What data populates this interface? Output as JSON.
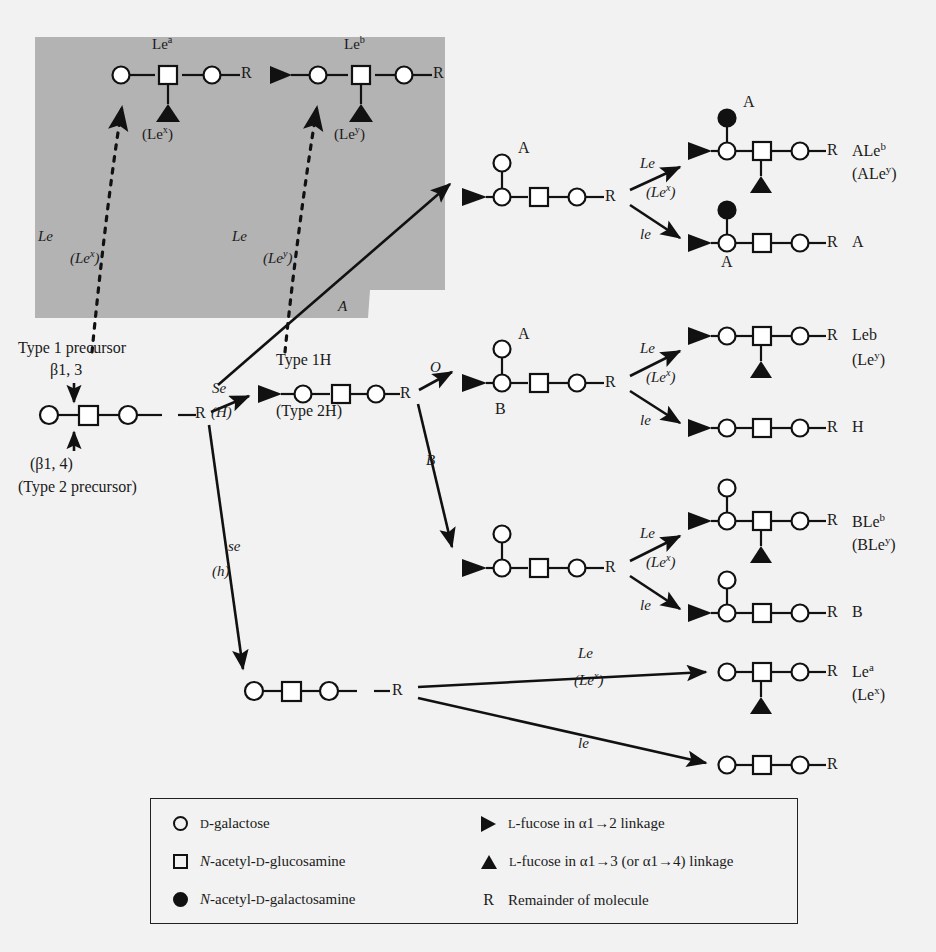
{
  "figure": {
    "background_color": "#f2f2f2",
    "shaded_panel_color": "#b3b3b3",
    "ink_color": "#111111"
  },
  "shaded_panel": {
    "name": "type-2-chain-panel",
    "structures": [
      {
        "label": "Le<sup>a</sup>",
        "sublabel": "(Le<sup>x</sup>)"
      },
      {
        "label": "Le<sup>b</sup>",
        "sublabel": "(Le<sup>y</sup>)"
      }
    ],
    "enzyme_labels": [
      {
        "gene": "Le",
        "alt": "(Le<sup>x</sup>)"
      },
      {
        "gene": "Le",
        "alt": "(Le<sup>y</sup>)"
      }
    ]
  },
  "precursor": {
    "title": "Type 1 precursor",
    "linkage_top": "β1, 3",
    "linkage_bottom": "(β1, 4)",
    "alt_title": "(Type 2 precursor)"
  },
  "h_node": {
    "label": "Type 1H",
    "alt_label": "(Type 2H)"
  },
  "pathway_labels": {
    "se_gene": "Se",
    "se_alt": "(H)",
    "se_null_gene": "se",
    "se_null_alt": "(h)",
    "a_gene": "A",
    "o_gene": "O",
    "b_gene": "B",
    "le_gene": "Le",
    "le_alt": "(Le<sup>x</sup>)",
    "le_null_gene": "le"
  },
  "intermediates": [
    {
      "name": "a-antigen-intermediate",
      "branch_label": "A",
      "under_label": ""
    },
    {
      "name": "o-h-intermediate",
      "branch_label": "A",
      "under_label": "B"
    },
    {
      "name": "b-antigen-intermediate",
      "branch_label": "",
      "under_label": ""
    },
    {
      "name": "non-secretor-intermediate",
      "branch_label": "",
      "under_label": ""
    }
  ],
  "products": [
    {
      "name": "ale-b",
      "label": "ALe<sup>b</sup>",
      "sublabel": "(ALe<sup>y</sup>)",
      "top_label": "A",
      "bottom_label": ""
    },
    {
      "name": "a",
      "label": "A",
      "sublabel": "",
      "top_label": "",
      "bottom_label": "A"
    },
    {
      "name": "le-b",
      "label": "Leb",
      "sublabel": "(Le<sup>y</sup>)",
      "top_label": "",
      "bottom_label": ""
    },
    {
      "name": "h",
      "label": "H",
      "sublabel": "",
      "top_label": "",
      "bottom_label": ""
    },
    {
      "name": "ble-b",
      "label": "BLe<sup>b</sup>",
      "sublabel": "(BLe<sup>y</sup>)",
      "top_label": "",
      "bottom_label": ""
    },
    {
      "name": "b",
      "label": "B",
      "sublabel": "",
      "top_label": "",
      "bottom_label": ""
    },
    {
      "name": "le-a",
      "label": "Le<sup>a</sup>",
      "sublabel": "(Le<sup>x</sup>)",
      "top_label": "",
      "bottom_label": ""
    },
    {
      "name": "plain",
      "label": "",
      "sublabel": "",
      "top_label": "",
      "bottom_label": ""
    }
  ],
  "legend": {
    "left": [
      {
        "icon": "open-circle-icon",
        "text": "<span class='sc'>D</span>-galactose"
      },
      {
        "icon": "open-square-icon",
        "text": "<i>N</i>-acetyl-<span class='sc'>D</span>-glucosamine"
      },
      {
        "icon": "filled-circle-icon",
        "text": "<i>N</i>-acetyl-<span class='sc'>D</span>-galactosamine"
      }
    ],
    "right": [
      {
        "icon": "right-triangle-icon",
        "text": "<span class='sc'>L</span>-fucose in α1→2 linkage"
      },
      {
        "icon": "up-triangle-icon",
        "text": "<span class='sc'>L</span>-fucose in α1→3 (or α1→4) linkage"
      },
      {
        "icon": "r-glyph",
        "text": "Remainder of molecule"
      }
    ]
  }
}
